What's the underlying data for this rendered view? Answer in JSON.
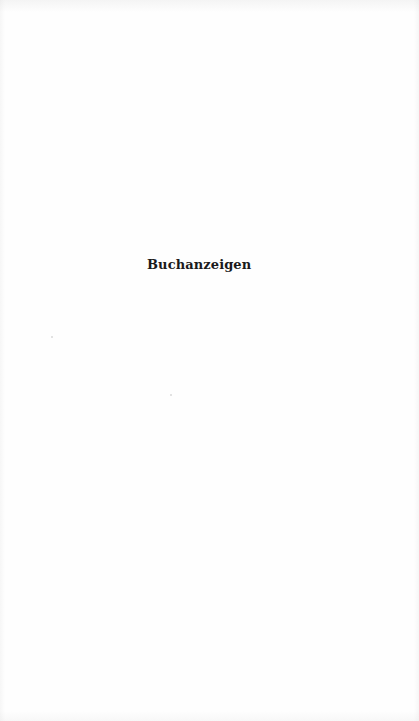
{
  "page": {
    "title": "Buchanzeigen"
  }
}
